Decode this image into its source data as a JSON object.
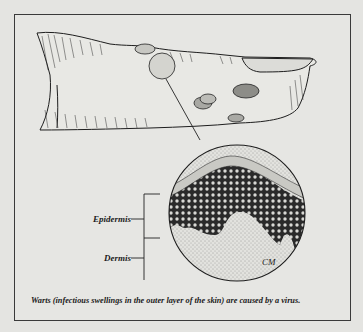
{
  "figure": {
    "labels": {
      "epidermis": "Epidermis",
      "dermis": "Dermis"
    },
    "signature": "CM",
    "caption": "Warts (infectious swellings in the outer layer of the skin) are caused by a virus."
  },
  "colors": {
    "background": "#e4e4e1",
    "ink": "#1c1c1c"
  }
}
